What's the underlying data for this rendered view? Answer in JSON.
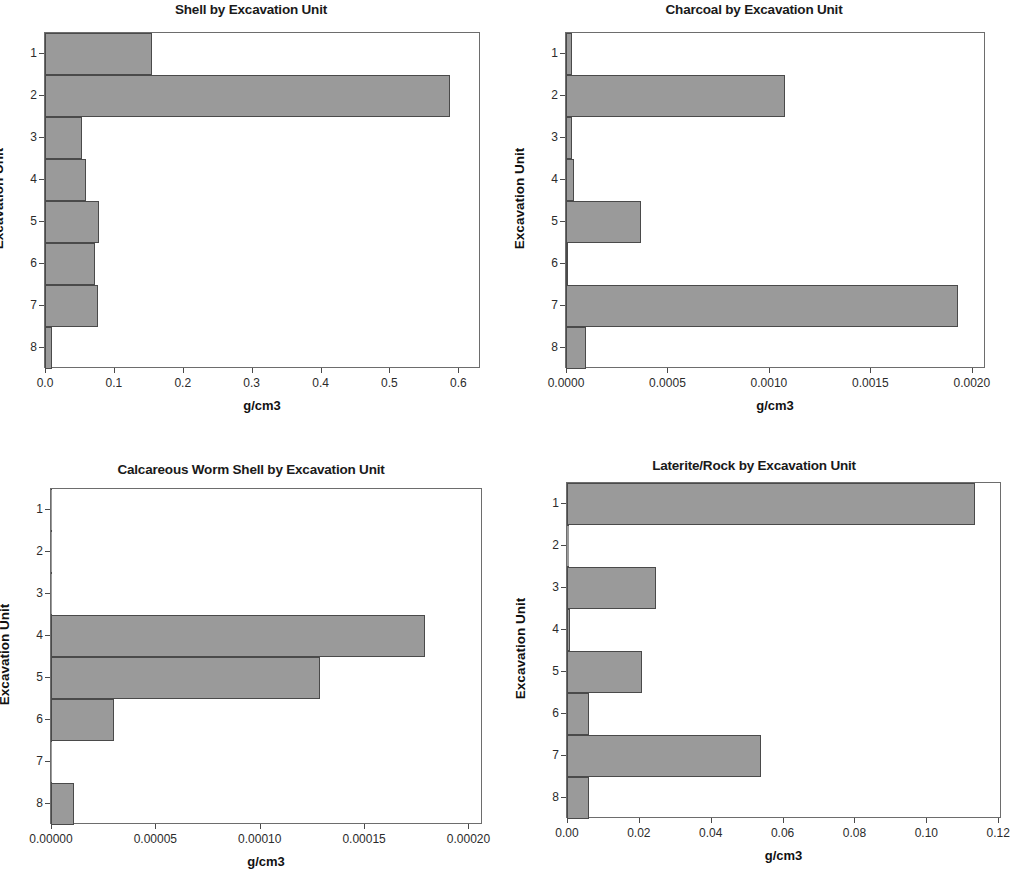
{
  "page": {
    "background": "#ffffff",
    "bar_fill": "#9a9a9a",
    "bar_stroke": "#4a4a4a",
    "axis_color": "#6d6d6d"
  },
  "chart_data": [
    {
      "id": "shell",
      "type": "bar",
      "orientation": "horizontal",
      "title": "Shell by Excavation Unit",
      "xlabel": "g/cm3",
      "ylabel": "Excavation Unit",
      "categories": [
        "1",
        "2",
        "3",
        "4",
        "5",
        "6",
        "7",
        "8"
      ],
      "values": [
        0.155,
        0.588,
        0.053,
        0.059,
        0.079,
        0.073,
        0.077,
        0.01
      ],
      "xticks": [
        "0.0",
        "0.1",
        "0.2",
        "0.3",
        "0.4",
        "0.5",
        "0.6"
      ],
      "xtick_values": [
        0.0,
        0.1,
        0.2,
        0.3,
        0.4,
        0.5,
        0.6
      ],
      "xlim": [
        0.0,
        0.63
      ],
      "grid": false,
      "legend": "none"
    },
    {
      "id": "charcoal",
      "type": "bar",
      "orientation": "horizontal",
      "title": "Charcoal by Excavation Unit",
      "xlabel": "g/cm3",
      "ylabel": "Excavation Unit",
      "categories": [
        "1",
        "2",
        "3",
        "4",
        "5",
        "6",
        "7",
        "8"
      ],
      "values": [
        3e-05,
        0.00108,
        3e-05,
        4e-05,
        0.00037,
        1e-05,
        0.00193,
        0.0001
      ],
      "xticks": [
        "0.0000",
        "0.0005",
        "0.0010",
        "0.0015",
        "0.0020"
      ],
      "xtick_values": [
        0.0,
        0.0005,
        0.001,
        0.0015,
        0.002
      ],
      "xlim": [
        0.0,
        0.00206
      ],
      "grid": false,
      "legend": "none"
    },
    {
      "id": "calcareous-worm-shell",
      "type": "bar",
      "orientation": "horizontal",
      "title": "Calcareous Worm Shell by Excavation Unit",
      "xlabel": "g/cm3",
      "ylabel": "Excavation Unit",
      "categories": [
        "1",
        "2",
        "3",
        "4",
        "5",
        "6",
        "7",
        "8"
      ],
      "values": [
        0.0,
        0.0,
        0.0,
        0.000179,
        0.000129,
        3e-05,
        0.0,
        1.1e-05
      ],
      "xticks": [
        "0.00000",
        "0.00005",
        "0.00010",
        "0.00015",
        "0.00020"
      ],
      "xtick_values": [
        0.0,
        5e-05,
        0.0001,
        0.00015,
        0.0002
      ],
      "xlim": [
        0.0,
        0.000206
      ],
      "grid": false,
      "legend": "none"
    },
    {
      "id": "laterite-rock",
      "type": "bar",
      "orientation": "horizontal",
      "title": "Laterite/Rock by Excavation Unit",
      "xlabel": "g/cm3",
      "ylabel": "Excavation Unit",
      "categories": [
        "1",
        "2",
        "3",
        "4",
        "5",
        "6",
        "7",
        "8"
      ],
      "values": [
        0.1135,
        0.0005,
        0.0248,
        0.0008,
        0.0209,
        0.0061,
        0.0541,
        0.0061
      ],
      "xticks": [
        "0.00",
        "0.02",
        "0.04",
        "0.06",
        "0.08",
        "0.10",
        "0.12"
      ],
      "xtick_values": [
        0.0,
        0.02,
        0.04,
        0.06,
        0.08,
        0.1,
        0.12
      ],
      "xlim": [
        0.0,
        0.1205
      ],
      "grid": false,
      "legend": "none"
    }
  ]
}
